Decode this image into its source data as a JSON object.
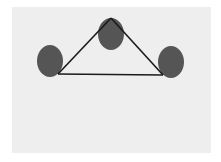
{
  "diagram": {
    "type": "triangle-graph",
    "background_color": "#eeeeee",
    "node_color": "#555555",
    "edge_color": "#1a1a1a",
    "nodes": [
      {
        "id": "left",
        "cx": 50,
        "cy": 61,
        "rx": 13,
        "ry": 16
      },
      {
        "id": "top",
        "cx": 111,
        "cy": 34,
        "rx": 13,
        "ry": 16
      },
      {
        "id": "right",
        "cx": 171,
        "cy": 62,
        "rx": 13,
        "ry": 16
      }
    ],
    "edges": [
      {
        "from": "left",
        "to": "top",
        "x1": 58,
        "y1": 74,
        "x2": 111,
        "y2": 18
      },
      {
        "from": "top",
        "to": "right",
        "x1": 111,
        "y1": 18,
        "x2": 163,
        "y2": 75
      },
      {
        "from": "left",
        "to": "right",
        "x1": 58,
        "y1": 74,
        "x2": 163,
        "y2": 75
      }
    ]
  }
}
